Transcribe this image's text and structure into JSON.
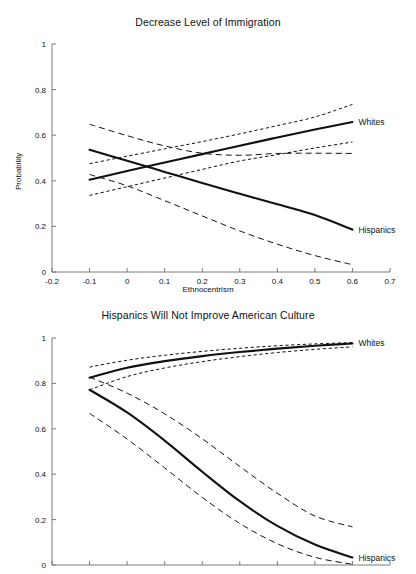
{
  "figure": {
    "width": 416,
    "height": 574,
    "background": "#ffffff",
    "line_color": "#111111",
    "axis_color": "#7a7a7a"
  },
  "chart_data": [
    {
      "type": "line",
      "title": "Decrease Level of Immigration",
      "xlabel": "Ethnocentrism",
      "ylabel": "Probability",
      "xlim": [
        -0.2,
        0.7
      ],
      "ylim": [
        0,
        1
      ],
      "xticks": [
        -0.2,
        -0.1,
        0,
        0.1,
        0.2,
        0.3,
        0.4,
        0.5,
        0.6,
        0.7
      ],
      "xticklabels": [
        "-0.2",
        "-0.1",
        "0",
        "0.1",
        "0.2",
        "0.3",
        "0.4",
        "0.5",
        "0.6",
        "0.7"
      ],
      "yticks": [
        0,
        0.2,
        0.4,
        0.6,
        0.8,
        1
      ],
      "yticklabels": [
        "0",
        "0.2",
        "0.4",
        "0.6",
        "0.8",
        "1"
      ],
      "grid": false,
      "legend_position": "right-inline",
      "x": [
        -0.1,
        0.0,
        0.1,
        0.2,
        0.3,
        0.4,
        0.5,
        0.6
      ],
      "series": [
        {
          "name": "Whites",
          "style": "solid",
          "annotation": "Whites",
          "values": [
            0.405,
            0.443,
            0.48,
            0.517,
            0.554,
            0.59,
            0.625,
            0.658
          ]
        },
        {
          "name": "Whites upper CI",
          "style": "dashed",
          "values": [
            0.475,
            0.508,
            0.54,
            0.572,
            0.606,
            0.642,
            0.68,
            0.735
          ]
        },
        {
          "name": "Whites lower CI",
          "style": "dashed",
          "values": [
            0.336,
            0.374,
            0.412,
            0.45,
            0.487,
            0.515,
            0.544,
            0.57
          ]
        },
        {
          "name": "Hispanics",
          "style": "solid",
          "annotation": "Hispanics",
          "values": [
            0.536,
            0.488,
            0.439,
            0.39,
            0.343,
            0.297,
            0.25,
            0.186
          ]
        },
        {
          "name": "Hispanics upper CI",
          "style": "dashed",
          "values": [
            0.648,
            0.598,
            0.553,
            0.521,
            0.512,
            0.52,
            0.521,
            0.52
          ]
        },
        {
          "name": "Hispanics lower CI",
          "style": "dashed",
          "values": [
            0.428,
            0.378,
            0.313,
            0.246,
            0.18,
            0.122,
            0.072,
            0.032
          ]
        }
      ]
    },
    {
      "type": "line",
      "title": "Hispanics Will Not Improve American Culture",
      "xlabel": "",
      "ylabel": "Probability",
      "xlim": [
        -0.2,
        0.7
      ],
      "ylim": [
        0,
        1
      ],
      "xticks": [
        -0.2,
        -0.1,
        0,
        0.1,
        0.2,
        0.3,
        0.4,
        0.5,
        0.6,
        0.7
      ],
      "xticklabels": [
        "",
        "",
        "",
        "",
        "",
        "",
        "",
        "",
        "",
        ""
      ],
      "yticks": [
        0,
        0.2,
        0.4,
        0.6,
        0.8,
        1
      ],
      "yticklabels": [
        "0",
        "0.2",
        "0.4",
        "0.6",
        "0.8",
        "1"
      ],
      "grid": false,
      "legend_position": "right-inline",
      "note": "x tick labels cropped off bottom of image",
      "x": [
        -0.1,
        0.0,
        0.1,
        0.2,
        0.3,
        0.4,
        0.5,
        0.6
      ],
      "series": [
        {
          "name": "Whites",
          "style": "solid",
          "annotation": "Whites",
          "values": [
            0.825,
            0.869,
            0.898,
            0.92,
            0.938,
            0.953,
            0.966,
            0.976
          ]
        },
        {
          "name": "Whites upper CI",
          "style": "dashed",
          "values": [
            0.872,
            0.902,
            0.924,
            0.941,
            0.955,
            0.966,
            0.974,
            0.98
          ]
        },
        {
          "name": "Whites lower CI",
          "style": "dashed",
          "values": [
            0.772,
            0.83,
            0.868,
            0.896,
            0.918,
            0.936,
            0.95,
            0.961
          ]
        },
        {
          "name": "Hispanics",
          "style": "solid",
          "annotation": "Hispanics",
          "values": [
            0.772,
            0.672,
            0.548,
            0.411,
            0.281,
            0.172,
            0.09,
            0.033
          ]
        },
        {
          "name": "Hispanics upper CI",
          "style": "dashed",
          "values": [
            0.828,
            0.757,
            0.666,
            0.556,
            0.434,
            0.316,
            0.216,
            0.168
          ]
        },
        {
          "name": "Hispanics lower CI",
          "style": "dashed",
          "values": [
            0.668,
            0.555,
            0.428,
            0.298,
            0.183,
            0.094,
            0.034,
            0.003
          ]
        }
      ]
    }
  ]
}
